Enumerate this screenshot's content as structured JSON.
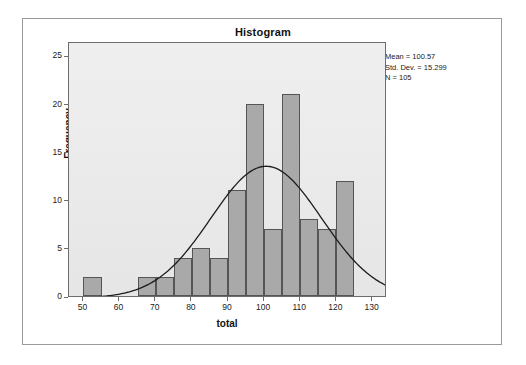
{
  "chart_data": {
    "type": "bar",
    "title": "Histogram",
    "xlabel": "total",
    "ylabel": "Frequency",
    "xlim": [
      46,
      134
    ],
    "ylim": [
      0,
      26.5
    ],
    "xticks": [
      50,
      60,
      70,
      80,
      90,
      100,
      110,
      120,
      130
    ],
    "yticks": [
      0,
      5,
      10,
      15,
      20,
      25
    ],
    "grid": false,
    "bin_width": 5,
    "bins": [
      {
        "start": 50,
        "end": 55,
        "value": 2
      },
      {
        "start": 65,
        "end": 70,
        "value": 2
      },
      {
        "start": 70,
        "end": 75,
        "value": 2
      },
      {
        "start": 75,
        "end": 80,
        "value": 4
      },
      {
        "start": 80,
        "end": 85,
        "value": 5
      },
      {
        "start": 85,
        "end": 90,
        "value": 4
      },
      {
        "start": 90,
        "end": 95,
        "value": 11
      },
      {
        "start": 95,
        "end": 100,
        "value": 20
      },
      {
        "start": 100,
        "end": 105,
        "value": 7
      },
      {
        "start": 105,
        "end": 110,
        "value": 21
      },
      {
        "start": 110,
        "end": 115,
        "value": 8
      },
      {
        "start": 115,
        "end": 120,
        "value": 7
      },
      {
        "start": 120,
        "end": 125,
        "value": 12
      }
    ],
    "categories": [
      "50-55",
      "65-70",
      "70-75",
      "75-80",
      "80-85",
      "85-90",
      "90-95",
      "95-100",
      "100-105",
      "105-110",
      "110-115",
      "115-120",
      "120-125"
    ],
    "values": [
      2,
      2,
      2,
      4,
      5,
      4,
      11,
      20,
      7,
      21,
      8,
      7,
      12
    ],
    "normal_curve": {
      "shown": true,
      "mean": 100.57,
      "std_dev": 15.299,
      "n": 105,
      "scale_note": "density * N * bin_width"
    },
    "annotations": [
      "Mean = 100.57",
      "Std. Dev. = 15.299",
      "N = 105"
    ],
    "colors": {
      "bar_fill": "#a9a9a9",
      "bar_border": "#555555",
      "curve": "#1d1d1d",
      "plot_background": "#ebebeb",
      "axis": "#6d6d6d",
      "page_background": "#ffffff"
    }
  },
  "stats": {
    "mean_label": "Mean = 100.57",
    "std_label": "Std. Dev. = 15.299",
    "n_label": "N = 105"
  }
}
